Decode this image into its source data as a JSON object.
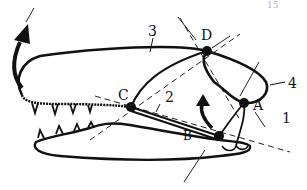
{
  "page_number_fragment": "15",
  "diagram": {
    "joints": [
      {
        "id": "A",
        "label": "A",
        "x": 244,
        "y": 103
      },
      {
        "id": "B",
        "label": "B",
        "x": 219,
        "y": 136
      },
      {
        "id": "C",
        "label": "C",
        "x": 131,
        "y": 107
      },
      {
        "id": "D",
        "label": "D",
        "x": 207,
        "y": 51
      }
    ],
    "links": [
      {
        "id": "1",
        "label": "1",
        "from": "A",
        "to": "B"
      },
      {
        "id": "2",
        "label": "2",
        "from": "C",
        "to": "B"
      },
      {
        "id": "3",
        "label": "3",
        "from": "C",
        "to": "D"
      },
      {
        "id": "4",
        "label": "4",
        "from": "D",
        "to": "A"
      }
    ],
    "arrows": [
      {
        "id": "snout-rotation-arrow",
        "meaning": "rotation of snout upward"
      },
      {
        "id": "quadrate-rotation-arrow",
        "meaning": "rotation near joint B"
      }
    ],
    "colors": {
      "ink": "#111111",
      "paper": "#ffffff"
    }
  }
}
